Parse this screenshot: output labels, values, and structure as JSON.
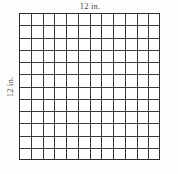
{
  "figure": {
    "type": "square-unit-grid",
    "top_label": "12 in.",
    "left_label": "12 in.",
    "columns": 12,
    "rows": 12,
    "total_cells": 144,
    "unit": "in.",
    "side_length": 12,
    "line_color": "#3a3a3a",
    "border_color": "#2e2e2e",
    "label_color": "#4a4a4a",
    "background_color": "#ffffff"
  },
  "chart_data": {
    "type": "table",
    "title": "",
    "xlabel": "12 in.",
    "ylabel": "12 in.",
    "categories": [
      "1",
      "2",
      "3",
      "4",
      "5",
      "6",
      "7",
      "8",
      "9",
      "10",
      "11",
      "12"
    ],
    "values": [
      12,
      12,
      12,
      12,
      12,
      12,
      12,
      12,
      12,
      12,
      12,
      12
    ],
    "grid": true
  }
}
